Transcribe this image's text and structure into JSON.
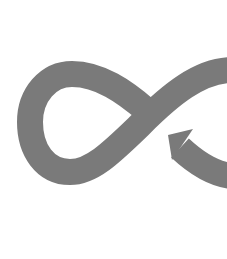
{
  "graphic": {
    "name": "infinity-loop-arrow",
    "colors": {
      "background": "#ffffff",
      "stroke": "#7a7a7a"
    }
  }
}
